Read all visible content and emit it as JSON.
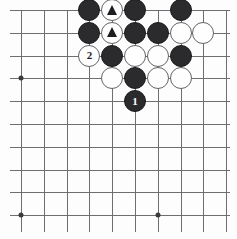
{
  "figure": {
    "kind": "go-board-diagram",
    "width": 237,
    "height": 239,
    "grid": {
      "columns": 10,
      "rows": 10,
      "origin_x": 21,
      "origin_y": 10,
      "spacing": 22.8,
      "line_color": "#6e6e70",
      "background_color": "#fdfdfd"
    },
    "star_points": [
      {
        "name": "star-point-left",
        "col": 0,
        "row": 3
      },
      {
        "name": "star-point-bottom-left",
        "col": 0,
        "row": 9
      },
      {
        "name": "star-point-bottom-center",
        "col": 6,
        "row": 9
      }
    ],
    "colors": {
      "black_stone": "#2b2b2d",
      "white_stone": "#fefefe",
      "white_stone_border": "#646467",
      "black_label_text": "#ffffff",
      "white_label_text": "#1d1d1f",
      "mark_color": "#1d1d1f"
    },
    "legend": {
      "black_move": "1",
      "white_move": "2",
      "marked_stones": "triangle"
    }
  },
  "stones": [
    {
      "id": "s1",
      "color": "black",
      "col": 3,
      "row": 0,
      "label": "",
      "mark": ""
    },
    {
      "id": "s2",
      "color": "white",
      "col": 4,
      "row": 0,
      "label": "",
      "mark": "triangle"
    },
    {
      "id": "s3",
      "color": "black",
      "col": 5,
      "row": 0,
      "label": "",
      "mark": ""
    },
    {
      "id": "s4",
      "color": "black",
      "col": 7,
      "row": 0,
      "label": "",
      "mark": ""
    },
    {
      "id": "s5",
      "color": "black",
      "col": 3,
      "row": 1,
      "label": "",
      "mark": ""
    },
    {
      "id": "s6",
      "color": "white",
      "col": 4,
      "row": 1,
      "label": "",
      "mark": "triangle"
    },
    {
      "id": "s7",
      "color": "black",
      "col": 5,
      "row": 1,
      "label": "",
      "mark": ""
    },
    {
      "id": "s8",
      "color": "black",
      "col": 6,
      "row": 1,
      "label": "",
      "mark": ""
    },
    {
      "id": "s9",
      "color": "white",
      "col": 7,
      "row": 1,
      "label": "",
      "mark": ""
    },
    {
      "id": "s10",
      "color": "white",
      "col": 8,
      "row": 1,
      "label": "",
      "mark": ""
    },
    {
      "id": "s11",
      "color": "white",
      "col": 3,
      "row": 2,
      "label": "2",
      "mark": ""
    },
    {
      "id": "s12",
      "color": "black",
      "col": 4,
      "row": 2,
      "label": "",
      "mark": ""
    },
    {
      "id": "s13",
      "color": "white",
      "col": 5,
      "row": 2,
      "label": "",
      "mark": ""
    },
    {
      "id": "s14",
      "color": "white",
      "col": 6,
      "row": 2,
      "label": "",
      "mark": ""
    },
    {
      "id": "s15",
      "color": "black",
      "col": 7,
      "row": 2,
      "label": "",
      "mark": ""
    },
    {
      "id": "s16",
      "color": "white",
      "col": 4,
      "row": 3,
      "label": "",
      "mark": ""
    },
    {
      "id": "s17",
      "color": "black",
      "col": 5,
      "row": 3,
      "label": "",
      "mark": ""
    },
    {
      "id": "s18",
      "color": "white",
      "col": 6,
      "row": 3,
      "label": "",
      "mark": ""
    },
    {
      "id": "s19",
      "color": "white",
      "col": 7,
      "row": 3,
      "label": "",
      "mark": ""
    },
    {
      "id": "s20",
      "color": "black",
      "col": 5,
      "row": 4,
      "label": "1",
      "mark": ""
    }
  ]
}
